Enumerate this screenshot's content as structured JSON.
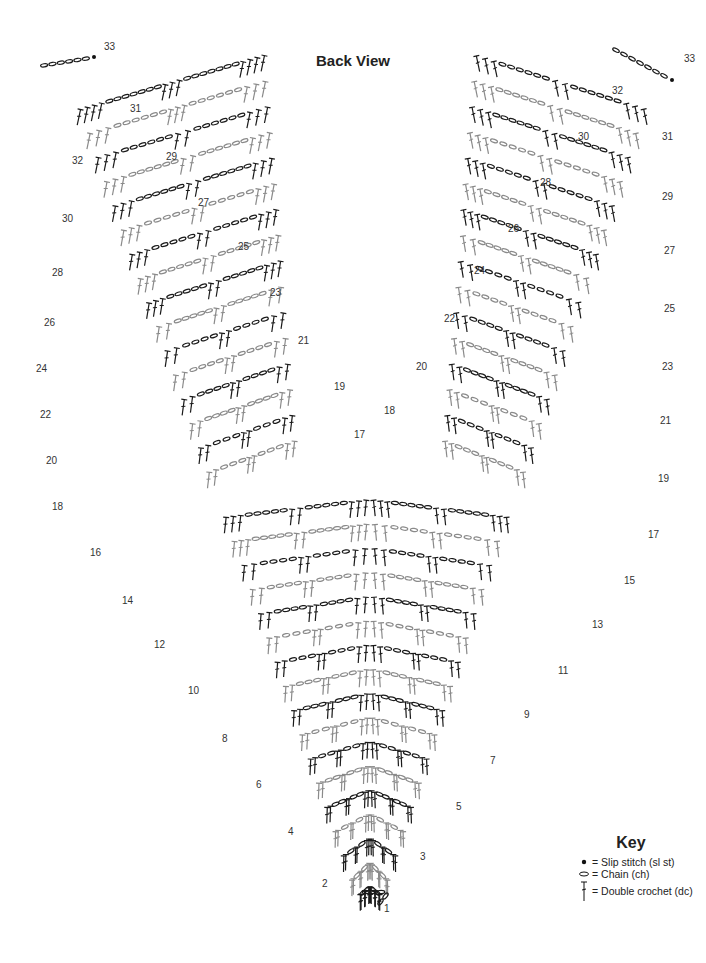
{
  "title": "Back View",
  "key": {
    "title": "Key",
    "items": [
      {
        "symbol": "slip-stitch-dot",
        "label": "= Slip stitch (sl st)"
      },
      {
        "symbol": "chain-oval",
        "label": "= Chain (ch)"
      },
      {
        "symbol": "double-crochet-t",
        "label": "= Double crochet (dc)"
      }
    ]
  },
  "diagram": {
    "row_count": 33,
    "left_arm_labels": [
      "2",
      "4",
      "6",
      "8",
      "10",
      "12",
      "14",
      "16",
      "18",
      "20",
      "22",
      "24",
      "26",
      "28",
      "30",
      "32"
    ],
    "left_arm_odd_labels": [
      "17",
      "19",
      "21",
      "23",
      "25",
      "27",
      "29",
      "31",
      "33"
    ],
    "right_arm_labels": [
      "1",
      "3",
      "5",
      "7",
      "9",
      "11",
      "13",
      "15",
      "17",
      "19",
      "21",
      "23",
      "25",
      "27",
      "29",
      "31",
      "33"
    ],
    "right_arm_even_labels": [
      "18",
      "20",
      "22",
      "24",
      "26",
      "28",
      "30",
      "32"
    ],
    "colors": {
      "dark": "#1a1a1a",
      "light": "#8a8a8a"
    }
  }
}
